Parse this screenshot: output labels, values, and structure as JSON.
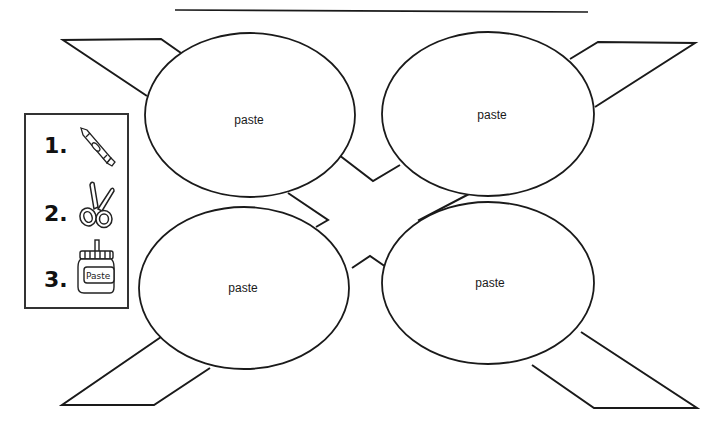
{
  "worksheet": {
    "name_line": "",
    "circles": [
      {
        "id": "top-left",
        "label": "paste",
        "cx": 250,
        "cy": 115,
        "rx": 105,
        "ry": 82
      },
      {
        "id": "top-right",
        "label": "paste",
        "cx": 488,
        "cy": 114,
        "rx": 106,
        "ry": 82
      },
      {
        "id": "bottom-left",
        "label": "paste",
        "cx": 244,
        "cy": 288,
        "rx": 105,
        "ry": 81
      },
      {
        "id": "bottom-right",
        "label": "paste",
        "cx": 488,
        "cy": 283,
        "rx": 106,
        "ry": 81
      }
    ],
    "instructions": {
      "steps": [
        {
          "number": "1.",
          "icon": "crayon-icon"
        },
        {
          "number": "2.",
          "icon": "scissors-icon"
        },
        {
          "number": "3.",
          "icon": "paste-jar-icon",
          "jar_label": "Paste"
        }
      ]
    },
    "stroke_color": "#1a1a1a"
  }
}
